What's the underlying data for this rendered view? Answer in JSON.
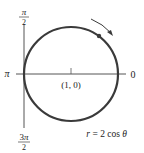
{
  "diagram": {
    "type": "polar-plot",
    "equation": "r = 2 cos θ",
    "equation_label": {
      "r": "r",
      "eq": " = 2 cos ",
      "theta": "θ"
    },
    "axis_labels": {
      "top_num": "π",
      "top_den": "2",
      "bottom_num": "3π",
      "bottom_den": "2",
      "left": "π",
      "right": "0"
    },
    "center_label": "(1, 0)",
    "curve": {
      "shape": "circle",
      "center": [
        1,
        0
      ],
      "radius": 1,
      "stroke": "#3a3a3a"
    },
    "direction_arrow": "clockwise-on-upper-right",
    "colors": {
      "curve": "#3a3a3a",
      "axis": "#555555",
      "text": "#222222"
    }
  }
}
